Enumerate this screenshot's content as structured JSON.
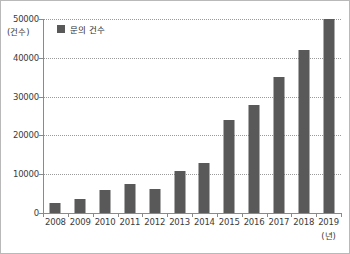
{
  "chart_data": {
    "type": "bar",
    "title": "",
    "xlabel": "(년)",
    "ylabel": "(건수)",
    "categories": [
      "2008",
      "2009",
      "2010",
      "2011",
      "2012",
      "2013",
      "2014",
      "2015",
      "2016",
      "2017",
      "2018",
      "2019"
    ],
    "values": [
      2500,
      3700,
      6000,
      7600,
      6200,
      10700,
      12800,
      24000,
      27800,
      35000,
      42000,
      50000
    ],
    "series": [
      {
        "name": "문의 건수",
        "color": "#595959",
        "values": [
          2500,
          3700,
          6000,
          7600,
          6200,
          10700,
          12800,
          24000,
          27800,
          35000,
          42000,
          50000
        ]
      }
    ],
    "ylim": [
      0,
      50000
    ],
    "yticks": [
      0,
      10000,
      20000,
      30000,
      40000,
      50000
    ],
    "ytick_labels": [
      "0",
      "10000",
      "20000",
      "30000",
      "40000",
      "50000"
    ],
    "grid": true,
    "grid_style": "dotted",
    "legend": {
      "position": "top-left-inside",
      "entries": [
        {
          "label": "문의 건수",
          "color": "#595959"
        }
      ]
    },
    "axis_color": "#8a8a8a",
    "border_color": "#b9b9b9",
    "background": "#ffffff"
  },
  "icons": {
    "legend_swatch": "square-swatch-icon"
  }
}
